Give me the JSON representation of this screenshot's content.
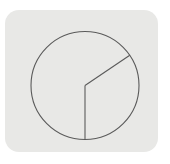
{
  "app": {
    "title": "Pie Chart Icon",
    "icon_name": "pie-chart-icon",
    "card_label": "Pie chart icon tile"
  },
  "colors": {
    "page_background": "#ffffff",
    "card_background": "#e8e8e6",
    "stroke": "#5a5a5a",
    "slice_fill": "transparent"
  },
  "card": {
    "x": 5,
    "y": 10,
    "width": 153,
    "height": 142,
    "corner_radius": 14
  },
  "chart_data": {
    "type": "pie",
    "title": "",
    "subtitle": "",
    "xlabel": "",
    "ylabel": "",
    "legend": [],
    "legend_position": "none",
    "grid": false,
    "labels_shown": false,
    "center": {
      "x": 85,
      "y": 85.5
    },
    "radius": 54,
    "start_angle_deg": 34,
    "direction": "clockwise",
    "categories": [
      "Slice A",
      "Slice B"
    ],
    "values": [
      124,
      236
    ],
    "percentages": [
      34.4,
      65.6
    ],
    "slices": [
      {
        "name": "Slice A",
        "value": 124,
        "percent": 34.4,
        "start_angle_deg": -34,
        "end_angle_deg": 90,
        "fill": "transparent",
        "stroke": "#5a5a5a"
      },
      {
        "name": "Slice B",
        "value": 236,
        "percent": 65.6,
        "start_angle_deg": 90,
        "end_angle_deg": 326,
        "fill": "transparent",
        "stroke": "#5a5a5a"
      }
    ],
    "dividers": [
      {
        "name": "divider-upper-right",
        "angle_deg": -34,
        "x2": 129.8,
        "y2": 55.3
      },
      {
        "name": "divider-down",
        "angle_deg": 90,
        "x2": 85,
        "y2": 139.5
      }
    ]
  }
}
